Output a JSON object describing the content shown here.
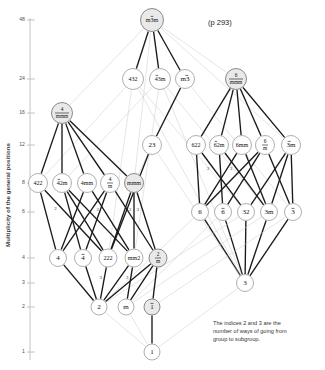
{
  "header": {
    "ghost_text": ""
  },
  "page_ref": "(p 293)",
  "axis": {
    "title": "Multiplicity of the general positions",
    "ticks": [
      {
        "label": "48",
        "y": 20
      },
      {
        "label": "24",
        "y": 79
      },
      {
        "label": "16",
        "y": 113
      },
      {
        "label": "12",
        "y": 145
      },
      {
        "label": "8",
        "y": 183
      },
      {
        "label": "6",
        "y": 212
      },
      {
        "label": "4",
        "y": 258
      },
      {
        "label": "3",
        "y": 283
      },
      {
        "label": "2",
        "y": 307
      },
      {
        "label": "1",
        "y": 352
      }
    ]
  },
  "caption": {
    "line1": "The indices 2 and 3 are the",
    "line2": "number of ways of going from",
    "line3": "group to subgroup."
  },
  "chart_data": {
    "type": "diagram",
    "ylabel": "Multiplicity of the general positions",
    "ytick_values": [
      48,
      24,
      16,
      12,
      8,
      6,
      4,
      3,
      2,
      1
    ],
    "nodes": [
      {
        "id": "m-3m",
        "label": "m3m",
        "over": "3",
        "x": 152,
        "y": 20,
        "order": 48,
        "shaded": true,
        "r": 11.5
      },
      {
        "id": "432",
        "label": "432",
        "over": "",
        "x": 133,
        "y": 79,
        "order": 24,
        "shaded": false,
        "r": 10.5
      },
      {
        "id": "-43m",
        "label": "43m",
        "over": "4",
        "x": 160,
        "y": 79,
        "order": 24,
        "shaded": false,
        "r": 10.5
      },
      {
        "id": "m-3",
        "label": "m3",
        "over": "3",
        "x": 185,
        "y": 79,
        "order": 24,
        "shaded": false,
        "r": 9.5
      },
      {
        "id": "6/mmm",
        "label": "6/mmm",
        "over": "",
        "x": 236,
        "y": 79,
        "order": 24,
        "shaded": true,
        "r": 10.5,
        "frac": [
          "6",
          "mmm"
        ]
      },
      {
        "id": "4/mmm",
        "label": "4/mmm",
        "over": "",
        "x": 62,
        "y": 113,
        "order": 16,
        "shaded": true,
        "r": 10.5,
        "frac": [
          "4",
          "mmm"
        ]
      },
      {
        "id": "622",
        "label": "622",
        "over": "",
        "x": 196,
        "y": 145,
        "order": 12,
        "shaded": false,
        "r": 9.5
      },
      {
        "id": "-62m",
        "label": "62m",
        "over": "6",
        "x": 219,
        "y": 145,
        "order": 12,
        "shaded": false,
        "r": 9.5
      },
      {
        "id": "6mm",
        "label": "6mm",
        "over": "",
        "x": 242,
        "y": 145,
        "order": 12,
        "shaded": false,
        "r": 9.5
      },
      {
        "id": "6/m",
        "label": "6/m",
        "over": "",
        "x": 265,
        "y": 145,
        "order": 12,
        "shaded": false,
        "r": 9.5,
        "frac": [
          "6",
          "m"
        ]
      },
      {
        "id": "-3m",
        "label": "3m",
        "over": "3",
        "x": 291,
        "y": 145,
        "order": 12,
        "shaded": false,
        "r": 9.5
      },
      {
        "id": "422",
        "label": "422",
        "over": "",
        "x": 38,
        "y": 183,
        "order": 8,
        "shaded": false,
        "r": 9.5
      },
      {
        "id": "-42m",
        "label": "42m",
        "over": "4",
        "x": 62,
        "y": 183,
        "order": 8,
        "shaded": false,
        "r": 9.5
      },
      {
        "id": "4mm",
        "label": "4mm",
        "over": "",
        "x": 87,
        "y": 183,
        "order": 8,
        "shaded": false,
        "r": 9.5
      },
      {
        "id": "4/m",
        "label": "4/m",
        "over": "",
        "x": 110,
        "y": 183,
        "order": 8,
        "shaded": false,
        "r": 9.5,
        "frac": [
          "4",
          "m"
        ]
      },
      {
        "id": "mmm",
        "label": "mmm",
        "over": "",
        "x": 134,
        "y": 183,
        "order": 8,
        "shaded": true,
        "r": 9.5
      },
      {
        "id": "6",
        "label": "6",
        "over": "",
        "x": 200,
        "y": 212,
        "order": 6,
        "shaded": false,
        "r": 8.5
      },
      {
        "id": "-6",
        "label": "6",
        "over": "6",
        "x": 223,
        "y": 212,
        "order": 6,
        "shaded": false,
        "r": 8.5
      },
      {
        "id": "32",
        "label": "32",
        "over": "",
        "x": 246,
        "y": 212,
        "order": 6,
        "shaded": false,
        "r": 8.5
      },
      {
        "id": "3m",
        "label": "3m",
        "over": "",
        "x": 269,
        "y": 212,
        "order": 6,
        "shaded": false,
        "r": 8.5
      },
      {
        "id": "-3",
        "label": "3",
        "over": "3",
        "x": 293,
        "y": 212,
        "order": 6,
        "shaded": false,
        "r": 8.5
      },
      {
        "id": "4",
        "label": "4",
        "over": "",
        "x": 58,
        "y": 258,
        "order": 4,
        "shaded": false,
        "r": 8.5
      },
      {
        "id": "-4",
        "label": "4",
        "over": "4",
        "x": 83,
        "y": 258,
        "order": 4,
        "shaded": false,
        "r": 8.5
      },
      {
        "id": "222",
        "label": "222",
        "over": "",
        "x": 108,
        "y": 258,
        "order": 4,
        "shaded": false,
        "r": 9
      },
      {
        "id": "mm2",
        "label": "mm2",
        "over": "",
        "x": 134,
        "y": 258,
        "order": 4,
        "shaded": false,
        "r": 9
      },
      {
        "id": "2/m",
        "label": "2/m",
        "over": "",
        "x": 158,
        "y": 258,
        "order": 4,
        "shaded": true,
        "r": 9,
        "frac": [
          "2",
          "m"
        ]
      },
      {
        "id": "3",
        "label": "3",
        "over": "",
        "x": 245,
        "y": 283,
        "order": 3,
        "shaded": false,
        "r": 8.5
      },
      {
        "id": "2",
        "label": "2",
        "over": "",
        "x": 99,
        "y": 307,
        "order": 2,
        "shaded": false,
        "r": 8
      },
      {
        "id": "m",
        "label": "m",
        "over": "",
        "x": 126,
        "y": 307,
        "order": 2,
        "shaded": false,
        "r": 8
      },
      {
        "id": "-1",
        "label": "1",
        "over": "1",
        "x": 152,
        "y": 307,
        "order": 2,
        "shaded": true,
        "r": 8
      },
      {
        "id": "1",
        "label": "1",
        "over": "",
        "x": 152,
        "y": 352,
        "order": 1,
        "shaded": false,
        "r": 8
      }
    ],
    "edges": [
      {
        "from": "m-3m",
        "to": "432",
        "style": "solid"
      },
      {
        "from": "m-3m",
        "to": "-43m",
        "style": "solid"
      },
      {
        "from": "m-3m",
        "to": "m-3",
        "style": "solid"
      },
      {
        "from": "m-3m",
        "to": "4/mmm",
        "style": "faint"
      },
      {
        "from": "m-3m",
        "to": "6/mmm",
        "style": "faint"
      },
      {
        "from": "m-3m",
        "to": "-3m",
        "style": "faint"
      },
      {
        "from": "m-3m",
        "to": "mmm",
        "style": "faint"
      },
      {
        "from": "432",
        "to": "422",
        "style": "faint"
      },
      {
        "from": "432",
        "to": "32",
        "style": "faint"
      },
      {
        "from": "432",
        "to": "222",
        "style": "faint"
      },
      {
        "from": "432",
        "to": "3",
        "style": "faint"
      },
      {
        "from": "-43m",
        "to": "-42m",
        "style": "faint"
      },
      {
        "from": "-43m",
        "to": "3m",
        "style": "faint"
      },
      {
        "from": "-43m",
        "to": "mm2",
        "style": "faint"
      },
      {
        "from": "-43m",
        "to": "3",
        "style": "faint"
      },
      {
        "from": "m-3",
        "to": "mmm",
        "style": "faint"
      },
      {
        "from": "m-3",
        "to": "-3",
        "style": "faint"
      },
      {
        "from": "m-3",
        "to": "23",
        "style": "solid"
      },
      {
        "from": "6/mmm",
        "to": "622",
        "style": "solid"
      },
      {
        "from": "6/mmm",
        "to": "-62m",
        "style": "solid"
      },
      {
        "from": "6/mmm",
        "to": "6mm",
        "style": "solid"
      },
      {
        "from": "6/mmm",
        "to": "6/m",
        "style": "solid"
      },
      {
        "from": "6/mmm",
        "to": "-3m",
        "style": "solid"
      },
      {
        "from": "4/mmm",
        "to": "422",
        "style": "solid"
      },
      {
        "from": "4/mmm",
        "to": "-42m",
        "style": "solid"
      },
      {
        "from": "4/mmm",
        "to": "4mm",
        "style": "solid"
      },
      {
        "from": "4/mmm",
        "to": "4/m",
        "style": "solid"
      },
      {
        "from": "4/mmm",
        "to": "mmm",
        "style": "solid"
      },
      {
        "from": "622",
        "to": "6",
        "style": "solid"
      },
      {
        "from": "622",
        "to": "32",
        "style": "solid",
        "index": "3"
      },
      {
        "from": "-62m",
        "to": "-6",
        "style": "solid"
      },
      {
        "from": "-62m",
        "to": "3m",
        "style": "solid",
        "index": "3"
      },
      {
        "from": "6mm",
        "to": "6",
        "style": "solid"
      },
      {
        "from": "6mm",
        "to": "3m",
        "style": "solid"
      },
      {
        "from": "6/m",
        "to": "6",
        "style": "solid"
      },
      {
        "from": "6/m",
        "to": "-6",
        "style": "solid"
      },
      {
        "from": "6/m",
        "to": "-3",
        "style": "solid"
      },
      {
        "from": "-3m",
        "to": "-3",
        "style": "solid"
      },
      {
        "from": "-3m",
        "to": "32",
        "style": "solid"
      },
      {
        "from": "-3m",
        "to": "3m",
        "style": "solid"
      },
      {
        "from": "422",
        "to": "4",
        "style": "solid"
      },
      {
        "from": "422",
        "to": "222",
        "style": "solid",
        "index": "2"
      },
      {
        "from": "-42m",
        "to": "-4",
        "style": "solid"
      },
      {
        "from": "-42m",
        "to": "222",
        "style": "solid"
      },
      {
        "from": "-42m",
        "to": "mm2",
        "style": "solid"
      },
      {
        "from": "4mm",
        "to": "4",
        "style": "solid"
      },
      {
        "from": "4mm",
        "to": "mm2",
        "style": "solid",
        "index": "2"
      },
      {
        "from": "4/m",
        "to": "4",
        "style": "solid"
      },
      {
        "from": "4/m",
        "to": "-4",
        "style": "solid"
      },
      {
        "from": "4/m",
        "to": "2/m",
        "style": "solid"
      },
      {
        "from": "mmm",
        "to": "222",
        "style": "solid"
      },
      {
        "from": "mmm",
        "to": "mm2",
        "style": "solid",
        "index": "3"
      },
      {
        "from": "mmm",
        "to": "2/m",
        "style": "solid",
        "index": "3"
      },
      {
        "from": "6",
        "to": "3",
        "style": "solid"
      },
      {
        "from": "6",
        "to": "2",
        "style": "faint"
      },
      {
        "from": "-6",
        "to": "3",
        "style": "solid"
      },
      {
        "from": "-6",
        "to": "m",
        "style": "faint"
      },
      {
        "from": "32",
        "to": "3",
        "style": "solid"
      },
      {
        "from": "32",
        "to": "2",
        "style": "faint"
      },
      {
        "from": "3m",
        "to": "3",
        "style": "solid"
      },
      {
        "from": "3m",
        "to": "m",
        "style": "faint"
      },
      {
        "from": "-3",
        "to": "3",
        "style": "solid"
      },
      {
        "from": "-3",
        "to": "-1",
        "style": "faint"
      },
      {
        "from": "4",
        "to": "2",
        "style": "solid"
      },
      {
        "from": "-4",
        "to": "2",
        "style": "solid"
      },
      {
        "from": "222",
        "to": "2",
        "style": "solid",
        "index": "3"
      },
      {
        "from": "mm2",
        "to": "2",
        "style": "solid"
      },
      {
        "from": "mm2",
        "to": "m",
        "style": "solid",
        "index": "2"
      },
      {
        "from": "2/m",
        "to": "2",
        "style": "solid"
      },
      {
        "from": "2/m",
        "to": "m",
        "style": "solid"
      },
      {
        "from": "2/m",
        "to": "-1",
        "style": "solid"
      },
      {
        "from": "2",
        "to": "1",
        "style": "faint"
      },
      {
        "from": "m",
        "to": "1",
        "style": "faint"
      },
      {
        "from": "-1",
        "to": "1",
        "style": "solid"
      },
      {
        "from": "3",
        "to": "1",
        "style": "faint"
      },
      {
        "from": "23",
        "to": "222",
        "style": "solid"
      },
      {
        "from": "23",
        "to": "3",
        "style": "faint"
      }
    ],
    "extra_nodes": [
      {
        "id": "23",
        "label": "23",
        "over": "",
        "x": 152,
        "y": 145,
        "order": 12,
        "shaded": false,
        "r": 9.5
      }
    ]
  }
}
